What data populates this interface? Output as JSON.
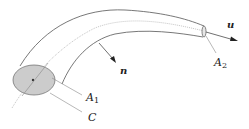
{
  "diagram": {
    "labels": {
      "u": "u",
      "n": "n",
      "A1_main": "A",
      "A1_sub": "1",
      "A2_main": "A",
      "A2_sub": "2",
      "C": "C"
    },
    "colors": {
      "stroke": "#555555",
      "centerline": "#aaaaaa",
      "fill_A1": "#cccccc",
      "text": "#222222"
    }
  }
}
